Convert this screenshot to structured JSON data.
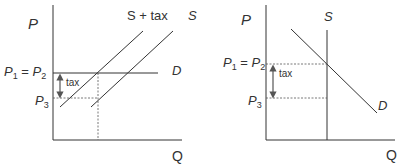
{
  "left_chart": {
    "y_axis_label": "P",
    "x_axis_label": "Q",
    "supply_tax_label": "S + tax",
    "supply_label": "S",
    "demand_label": "D",
    "p1_eq_p2": {
      "p1": "P",
      "sub1": "1",
      "eq": " = ",
      "p2": "P",
      "sub2": "2"
    },
    "p3": {
      "p": "P",
      "sub": "3"
    },
    "tax_label": "tax"
  },
  "right_chart": {
    "y_axis_label": "P",
    "x_axis_label": "Q",
    "supply_label": "S",
    "demand_label": "D",
    "p1_eq_p2": {
      "p1": "P",
      "sub1": "1",
      "eq": " = ",
      "p2": "P",
      "sub2": "2"
    },
    "p3": {
      "p": "P",
      "sub": "3"
    },
    "tax_label": "tax"
  },
  "colors": {
    "line": "#333333",
    "dotted": "#555555",
    "arrow": "#555555"
  }
}
